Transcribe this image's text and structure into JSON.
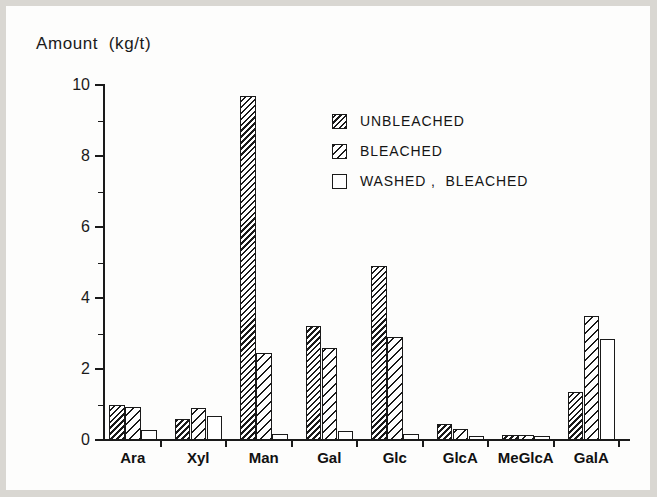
{
  "chart_data": {
    "type": "bar",
    "title": "",
    "ylabel": "Amount  (kg/t)",
    "xlabel": "",
    "ylim": [
      0,
      10
    ],
    "yticks": [
      0,
      2,
      4,
      6,
      8,
      10
    ],
    "ytick_labels": [
      "0",
      "2",
      "4",
      "6",
      "8",
      "10"
    ],
    "yminor_ticks": [
      1,
      3,
      5,
      7,
      9
    ],
    "grid": false,
    "legend_position": "upper center",
    "categories": [
      "Ara",
      "Xyl",
      "Man",
      "Gal",
      "Glc",
      "GlcA",
      "MeGlcA",
      "GalA"
    ],
    "series": [
      {
        "name": "UNBLEACHED",
        "pattern": "dense-hatch",
        "color": "#1a1a1a",
        "values": [
          1.0,
          0.6,
          9.7,
          3.2,
          4.9,
          0.45,
          0.13,
          1.35
        ]
      },
      {
        "name": "BLEACHED",
        "pattern": "light-hatch",
        "color": "#1a1a1a",
        "values": [
          0.93,
          0.9,
          2.45,
          2.6,
          2.9,
          0.3,
          0.13,
          3.5
        ]
      },
      {
        "name": "WASHED ,  BLEACHED",
        "pattern": "empty",
        "color": "#ffffff",
        "values": [
          0.27,
          0.68,
          0.18,
          0.25,
          0.17,
          0.1,
          0.12,
          2.85
        ]
      }
    ]
  },
  "legend": {
    "items": [
      {
        "label": "UNBLEACHED"
      },
      {
        "label": "BLEACHED"
      },
      {
        "label": "WASHED ,  BLEACHED"
      }
    ]
  },
  "axes": {
    "y_title": "Amount  (kg/t)"
  }
}
